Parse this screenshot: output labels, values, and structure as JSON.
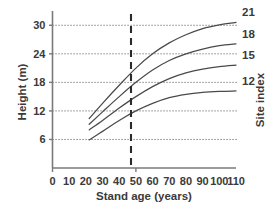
{
  "chart_data": {
    "type": "line",
    "title": "",
    "subtitle": "",
    "xlabel": "Stand age (years)",
    "ylabel": "Height (m)",
    "y2label": "Site index",
    "xlim": [
      0,
      110
    ],
    "ylim": [
      0,
      33
    ],
    "xticks": [
      0,
      10,
      20,
      30,
      40,
      50,
      60,
      70,
      80,
      90,
      100,
      110
    ],
    "xtick_labels": [
      "0",
      "10",
      "20",
      "30",
      "40",
      "50",
      "60",
      "70",
      "80",
      "90",
      "100",
      "110"
    ],
    "yticks": [
      6,
      12,
      18,
      24,
      30
    ],
    "ytick_labels": [
      "6",
      "12",
      "18",
      "24",
      "30"
    ],
    "grid": "horizontal dotted gridlines at each y tick",
    "legend_position": "right-of-curve-ends",
    "annotations": [
      {
        "name": "index-age-reference",
        "type": "vertical-dashed-line",
        "x": 50,
        "label": ""
      }
    ],
    "series": [
      {
        "name": "21",
        "label": "21",
        "end_label_value": "21",
        "x": [
          22,
          30,
          40,
          50,
          60,
          70,
          80,
          90,
          100,
          110
        ],
        "values": [
          10.4,
          13.6,
          17.4,
          21.0,
          24.0,
          26.3,
          28.0,
          29.3,
          30.1,
          30.6
        ]
      },
      {
        "name": "18",
        "label": "18",
        "end_label_value": "18",
        "x": [
          22,
          30,
          40,
          50,
          60,
          70,
          80,
          90,
          100,
          110
        ],
        "values": [
          9.2,
          11.8,
          15.0,
          18.0,
          20.6,
          22.6,
          24.0,
          25.0,
          25.7,
          26.1
        ]
      },
      {
        "name": "15",
        "label": "15",
        "end_label_value": "15",
        "x": [
          22,
          30,
          40,
          50,
          60,
          70,
          80,
          90,
          100,
          110
        ],
        "values": [
          8.0,
          10.0,
          12.6,
          15.0,
          17.1,
          18.8,
          20.0,
          20.8,
          21.3,
          21.6
        ]
      },
      {
        "name": "12",
        "label": "12",
        "end_label_value": "12",
        "x": [
          22,
          30,
          40,
          50,
          60,
          70,
          80,
          90,
          100,
          110
        ],
        "values": [
          5.9,
          7.7,
          10.0,
          12.0,
          13.6,
          14.8,
          15.5,
          15.9,
          16.1,
          16.2
        ]
      }
    ],
    "colors": {
      "curve": "#4a4a4a",
      "axis": "#7a7a7a",
      "grid": "#5a5a5a",
      "reference_line": "#2b2b2b",
      "text": "#3a3a3a",
      "background": "#ffffff"
    }
  }
}
